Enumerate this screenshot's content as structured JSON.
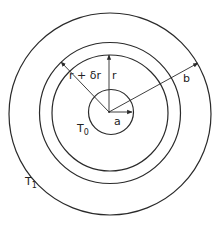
{
  "diagram": {
    "type": "concentric-circles",
    "center": [
      110,
      113
    ],
    "colors": {
      "stroke": "#2a2a2a",
      "background": "#ffffff"
    },
    "circles": [
      {
        "name": "inner-boundary",
        "radius": 23
      },
      {
        "name": "shell-r",
        "radius": 58
      },
      {
        "name": "shell-r-plus-dr",
        "radius": 71
      },
      {
        "name": "outer-boundary",
        "radius": 101
      }
    ],
    "labels": {
      "r_plus_dr": "r + δr",
      "r": "r",
      "a": "a",
      "b": "b",
      "T0_base": "T",
      "T0_sub": "0",
      "T1_base": "T",
      "T1_sub": "1"
    }
  }
}
